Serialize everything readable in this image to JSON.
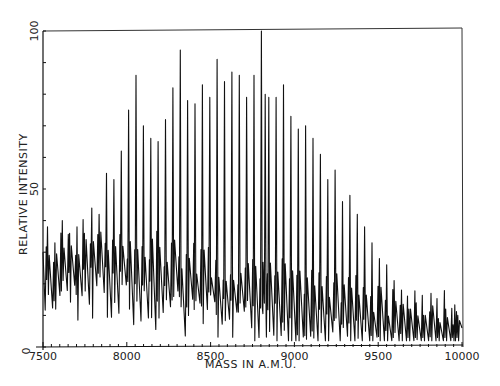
{
  "chart_data": {
    "type": "line",
    "title": "",
    "xlabel": "MASS IN A.M.U.",
    "ylabel": "RELATIVE INTENSITY",
    "xlim": [
      7500,
      10000
    ],
    "ylim": [
      0,
      100
    ],
    "x_ticks": [
      7500,
      8000,
      8500,
      9000,
      9500,
      10000
    ],
    "x_tick_labels": [
      "7500",
      "8000",
      "8500",
      "9000",
      "9500",
      "10000"
    ],
    "y_ticks": [
      0,
      50,
      100
    ],
    "y_tick_labels": [
      "0",
      "50",
      "100"
    ],
    "grid": false,
    "legend": null,
    "line_color": "#111111",
    "background_baseline": [
      [
        7500,
        28
      ],
      [
        7600,
        30
      ],
      [
        7700,
        32
      ],
      [
        7800,
        33
      ],
      [
        7900,
        32
      ],
      [
        8000,
        31
      ],
      [
        8100,
        30
      ],
      [
        8200,
        29
      ],
      [
        8300,
        28
      ],
      [
        8400,
        27
      ],
      [
        8500,
        25
      ],
      [
        8600,
        24
      ],
      [
        8700,
        23
      ],
      [
        8800,
        22
      ],
      [
        8900,
        21
      ],
      [
        9000,
        20
      ],
      [
        9100,
        19
      ],
      [
        9200,
        18
      ],
      [
        9300,
        17
      ],
      [
        9400,
        16
      ],
      [
        9500,
        14
      ],
      [
        9600,
        13
      ],
      [
        9700,
        12
      ],
      [
        9800,
        11
      ],
      [
        9900,
        10
      ],
      [
        10000,
        8
      ]
    ],
    "peaks": {
      "mass": [
        7527,
        7571,
        7615,
        7659,
        7703,
        7747,
        7791,
        7835,
        7879,
        7923,
        7967,
        8011,
        8055,
        8099,
        8143,
        8187,
        8231,
        8275,
        8319,
        8363,
        8407,
        8451,
        8495,
        8539,
        8583,
        8627,
        8671,
        8715,
        8759,
        8803,
        8826,
        8847,
        8891,
        8935,
        8979,
        9023,
        9067,
        9111,
        9155,
        9199,
        9243,
        9287,
        9331,
        9375,
        9419,
        9463,
        9507,
        9551,
        9595,
        9639,
        9683,
        9727,
        9771,
        9815,
        9859,
        9903,
        9947,
        9975
      ],
      "intensity": [
        38,
        33,
        40,
        36,
        38,
        36,
        44,
        42,
        55,
        53,
        62,
        75,
        86,
        70,
        66,
        65,
        72,
        82,
        94,
        78,
        77,
        83,
        79,
        91,
        84,
        87,
        86,
        79,
        86,
        100,
        80,
        79,
        79,
        83,
        73,
        69,
        70,
        66,
        61,
        53,
        56,
        46,
        48,
        42,
        38,
        33,
        28,
        26,
        21,
        18,
        12,
        14,
        10,
        17,
        9,
        12,
        7,
        10
      ]
    }
  }
}
